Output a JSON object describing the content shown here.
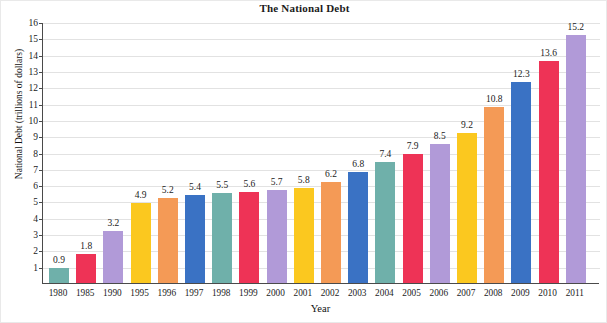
{
  "chart_data": {
    "type": "bar",
    "title": "The National Debt",
    "xlabel": "Year",
    "ylabel": "National Debt (trillions of dollars)",
    "ylim": [
      0,
      16
    ],
    "grid": true,
    "legend": "none",
    "ytick_labels": [
      "16",
      "15",
      "14",
      "13",
      "12",
      "11",
      "10",
      "9",
      "8",
      "7",
      "6",
      "5",
      "4",
      "3",
      "2",
      "1"
    ],
    "yticks": [
      16,
      15,
      14,
      13,
      12,
      11,
      10,
      9,
      8,
      7,
      6,
      5,
      4,
      3,
      2,
      1
    ],
    "categories": [
      "1980",
      "1985",
      "1990",
      "1995",
      "1996",
      "1997",
      "1998",
      "1999",
      "2000",
      "2001",
      "2002",
      "2003",
      "2004",
      "2005",
      "2006",
      "2007",
      "2008",
      "2009",
      "2010",
      "2011"
    ],
    "values": [
      0.9,
      1.8,
      3.2,
      4.9,
      5.2,
      5.4,
      5.5,
      5.6,
      5.7,
      5.8,
      6.2,
      6.8,
      7.4,
      7.9,
      8.5,
      9.2,
      10.8,
      12.3,
      13.6,
      15.2
    ],
    "value_labels": [
      "0.9",
      "1.8",
      "3.2",
      "4.9",
      "5.2",
      "5.4",
      "5.5",
      "5.6",
      "5.7",
      "5.8",
      "6.2",
      "6.8",
      "7.4",
      "7.9",
      "8.5",
      "9.2",
      "10.8",
      "12.3",
      "13.6",
      "15.2"
    ],
    "bar_colors": [
      "#6fb0aa",
      "#ee3356",
      "#b19ad8",
      "#fbc81f",
      "#f49a56",
      "#3a72c4",
      "#6fb0aa",
      "#ee3356",
      "#b19ad8",
      "#fbc81f",
      "#f49a56",
      "#3a72c4",
      "#6fb0aa",
      "#ee3356",
      "#b19ad8",
      "#fbc81f",
      "#f49a56",
      "#3a72c4",
      "#ee3356",
      "#b19ad8"
    ],
    "palette": {
      "teal": "#6fb0aa",
      "crimson": "#ee3356",
      "purple": "#b19ad8",
      "yellow": "#fbc81f",
      "orange": "#f49a56",
      "blue": "#3a72c4",
      "gridline": "#e2e2e2",
      "axis": "#4a4a4a",
      "text": "#1b1b1b",
      "background": "#ffffff"
    }
  }
}
